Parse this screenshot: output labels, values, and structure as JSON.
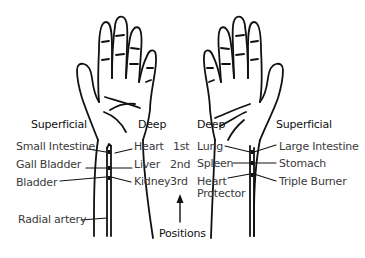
{
  "diagram": {
    "left_wrist": {
      "superficial_header": "Superficial",
      "deep_header": "Deep",
      "superficial": [
        "Small Intestine",
        "Gall Bladder",
        "Bladder"
      ],
      "deep": [
        "Heart",
        "Liver",
        "Kidney"
      ],
      "artery_label": "Radial artery"
    },
    "right_wrist": {
      "deep_header": "Deep",
      "superficial_header": "Superficial",
      "deep": [
        "Lung",
        "Spleen",
        "Heart Protector"
      ],
      "deep_line1": "Heart",
      "deep_line2": "Protector",
      "superficial": [
        "Large Intestine",
        "Stomach",
        "Triple Burner"
      ]
    },
    "positions": [
      "1st",
      "2nd",
      "3rd"
    ],
    "positions_label": "Positions",
    "colors": {
      "line": "#111111",
      "text": "#3a3a3a",
      "background": "#ffffff"
    }
  }
}
